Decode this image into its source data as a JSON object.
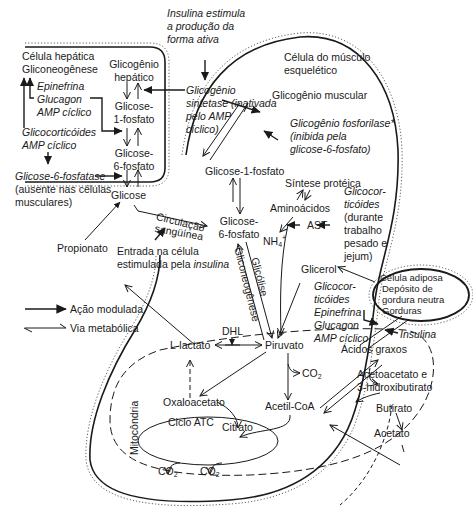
{
  "diagram": {
    "type": "metabolic-pathway",
    "compartments": {
      "liver": "Célula hepática",
      "muscle_line1": "Célula do músculo",
      "muscle_line2": "esquelético",
      "mitochondria": "Mitocôndria",
      "adipose_line1": "Célula adiposa",
      "adipose_line2": "Depósito de",
      "adipose_line3": "gordura neutra",
      "adipose_line4": "Gorduras"
    },
    "liver": {
      "gluconeogenesis": "Gliconeogênese",
      "regulators": [
        "Epinefrina",
        "Glucagon",
        "AMP cíclico"
      ],
      "glucocorticoids": "Glicocorticóides",
      "camp": "AMP cíclico",
      "g6pase_line1": "Glicose-6-fosfatase",
      "g6pase_line2": "(ausente nas células",
      "g6pase_line3": "musculares)",
      "glycogen_line1": "Glicogênio",
      "glycogen_line2": "hepático",
      "g1p_line1": "Glicose-",
      "g1p_line2": "1-fosfato",
      "g6p_line1": "Glicose-",
      "g6p_line2": "6-fosfato",
      "glucose": "Glicose"
    },
    "insulin_note": [
      "Insulina estimula",
      "a produção da",
      "forma ativa"
    ],
    "synthase": [
      "Glicogênio",
      "sintetase (inativada",
      "pelo AMP",
      "cíclico)"
    ],
    "muscle": {
      "glycogen": "Glicogênio muscular",
      "phosphorylase": [
        "Glicogênio fosforilase*",
        "(inibida pela",
        "glicose-6-fosfato)"
      ],
      "g1p": "Glicose-1-fosfato",
      "g6p_line1": "Glicose-",
      "g6p_line2": "6-fosfato",
      "protein_synthesis": "Síntese protéica",
      "amino_acids": "Aminoácidos",
      "ast": "AST",
      "nh4": "NH",
      "glucocorticoids_work": [
        "Glicocor-",
        "ticóides",
        "(durante",
        "trabalho",
        "pesado e",
        "jejum)"
      ],
      "glycerol": "Glicerol",
      "lipolysis_regulators": [
        "Glicocor-",
        "ticóides",
        "Epinefrina",
        "Glucagon",
        "AMP cíclico"
      ],
      "gluconeogenesis_label": "Gliconeogênese",
      "glycolysis_label": "Glicólise",
      "dhl": "DHL",
      "lactate": "L-lactato",
      "pyruvate": "Piruvato",
      "co2": "CO",
      "acetyl_coa": "Acetil-CoA",
      "oxaloacetate": "Oxaloacetato",
      "tca": "Ciclo ATC",
      "citrate": "Citrato",
      "fatty_acids": "Ácidos graxos",
      "ketones_line1": "Acetoacetato e",
      "ketones_line2": "3-hidroxibutirato",
      "butyrate": "Butirato",
      "acetate": "Acetato",
      "insulin": "Insulina"
    },
    "circulation_line1": "Circulação",
    "circulation_line2": "sangüínea",
    "propionate": "Propionato",
    "entry_line1": "Entrada na célula",
    "entry_line2_prefix": "estimulada pela ",
    "entry_line2_italic": "insulina",
    "legend": {
      "modulated_action": "Ação modulada",
      "metabolic_pathway": "Via metabólica"
    },
    "colors": {
      "ink": "#1a1a1a",
      "background": "#ffffff"
    }
  }
}
